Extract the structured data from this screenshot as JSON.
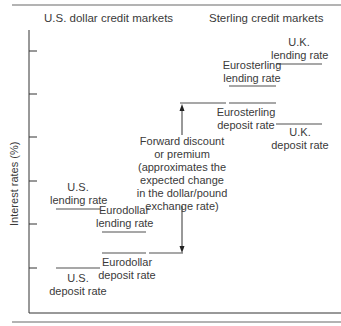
{
  "diagram": {
    "headers": {
      "left": "U.S. dollar credit markets",
      "right": "Sterling credit markets"
    },
    "y_axis_label": "Interest rates (%)",
    "rates": {
      "us_lending": {
        "line1": "U.S.",
        "line2": "lending rate"
      },
      "eurodollar_lending": {
        "line1": "Eurodollar",
        "line2": "lending rate"
      },
      "eurodollar_deposit": {
        "line1": "Eurodollar",
        "line2": "deposit rate"
      },
      "us_deposit": {
        "line1": "U.S.",
        "line2": "deposit rate"
      },
      "uk_lending": {
        "line1": "U.K.",
        "line2": "lending rate"
      },
      "eurosterling_lending": {
        "line1": "Eurosterling",
        "line2": "lending rate"
      },
      "eurosterling_deposit": {
        "line1": "Eurosterling",
        "line2": "deposit rate"
      },
      "uk_deposit": {
        "line1": "U.K.",
        "line2": "deposit rate"
      }
    },
    "annotation": {
      "lines": [
        "Forward discount",
        "or premium",
        "(approximates the",
        "expected change",
        "in the dollar/pound",
        "exchange rate)"
      ]
    },
    "colors": {
      "axis": "#333333",
      "rate_line": "#8a8a8a",
      "rule": "#9a9a9a",
      "text": "#3a3a3a"
    }
  }
}
